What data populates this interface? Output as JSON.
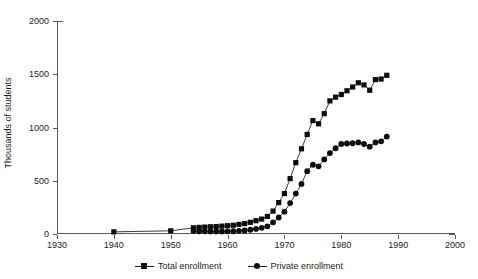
{
  "chart_data": {
    "type": "line",
    "title": "",
    "xlabel": "",
    "ylabel": "Thousands of students",
    "xlim": [
      1930,
      2000
    ],
    "ylim": [
      0,
      2000
    ],
    "xticks": [
      1930,
      1940,
      1950,
      1960,
      1970,
      1980,
      1990,
      2000
    ],
    "yticks": [
      0,
      500,
      1000,
      1500,
      2000
    ],
    "grid": false,
    "legend_position": "bottom",
    "series": [
      {
        "name": "Total enrollment",
        "marker": "square",
        "color": "#0d0d0d",
        "points": [
          [
            1940,
            20
          ],
          [
            1950,
            30
          ],
          [
            1954,
            58
          ],
          [
            1955,
            62
          ],
          [
            1956,
            65
          ],
          [
            1957,
            68
          ],
          [
            1958,
            70
          ],
          [
            1959,
            74
          ],
          [
            1960,
            78
          ],
          [
            1961,
            82
          ],
          [
            1962,
            90
          ],
          [
            1963,
            98
          ],
          [
            1964,
            110
          ],
          [
            1965,
            125
          ],
          [
            1966,
            140
          ],
          [
            1967,
            165
          ],
          [
            1968,
            215
          ],
          [
            1969,
            295
          ],
          [
            1970,
            380
          ],
          [
            1971,
            520
          ],
          [
            1972,
            670
          ],
          [
            1973,
            800
          ],
          [
            1974,
            935
          ],
          [
            1975,
            1065
          ],
          [
            1976,
            1035
          ],
          [
            1977,
            1130
          ],
          [
            1978,
            1250
          ],
          [
            1979,
            1285
          ],
          [
            1980,
            1310
          ],
          [
            1981,
            1345
          ],
          [
            1982,
            1380
          ],
          [
            1983,
            1420
          ],
          [
            1984,
            1400
          ],
          [
            1985,
            1350
          ],
          [
            1986,
            1450
          ],
          [
            1987,
            1455
          ],
          [
            1988,
            1490
          ]
        ]
      },
      {
        "name": "Private enrollment",
        "marker": "circle",
        "color": "#0d0d0d",
        "points": [
          [
            1954,
            28
          ],
          [
            1955,
            26
          ],
          [
            1956,
            25
          ],
          [
            1957,
            24
          ],
          [
            1958,
            24
          ],
          [
            1959,
            24
          ],
          [
            1960,
            25
          ],
          [
            1961,
            26
          ],
          [
            1962,
            30
          ],
          [
            1963,
            34
          ],
          [
            1964,
            40
          ],
          [
            1965,
            48
          ],
          [
            1966,
            58
          ],
          [
            1967,
            72
          ],
          [
            1968,
            110
          ],
          [
            1969,
            155
          ],
          [
            1970,
            210
          ],
          [
            1971,
            290
          ],
          [
            1972,
            380
          ],
          [
            1973,
            470
          ],
          [
            1974,
            590
          ],
          [
            1975,
            650
          ],
          [
            1976,
            635
          ],
          [
            1977,
            700
          ],
          [
            1978,
            760
          ],
          [
            1979,
            805
          ],
          [
            1980,
            845
          ],
          [
            1981,
            850
          ],
          [
            1982,
            852
          ],
          [
            1983,
            860
          ],
          [
            1984,
            845
          ],
          [
            1985,
            820
          ],
          [
            1986,
            860
          ],
          [
            1987,
            870
          ],
          [
            1988,
            915
          ]
        ]
      }
    ]
  },
  "axes": {
    "y_title": "Thousands of students",
    "y_tick_labels": [
      "0",
      "500",
      "1000",
      "1500",
      "2000"
    ],
    "x_tick_labels": [
      "1930",
      "1940",
      "1950",
      "1960",
      "1970",
      "1980",
      "1990",
      "2000"
    ]
  },
  "legend": {
    "items": [
      {
        "label": "Total enrollment",
        "marker": "square"
      },
      {
        "label": "Private enrollment",
        "marker": "circle"
      }
    ]
  }
}
